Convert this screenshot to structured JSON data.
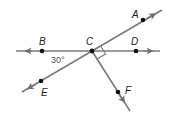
{
  "figure": {
    "type": "geometry",
    "colors": {
      "line": "#7a7a7a",
      "point": "#111111",
      "label": "#222222",
      "angle_label": "#555555"
    },
    "points": [
      {
        "id": "A",
        "label": "A",
        "x": 143,
        "y": 20,
        "lx": 132,
        "ly": 18
      },
      {
        "id": "B",
        "label": "B",
        "x": 42,
        "y": 51,
        "lx": 39,
        "ly": 44
      },
      {
        "id": "C",
        "label": "C",
        "x": 92,
        "y": 51,
        "lx": 87,
        "ly": 44
      },
      {
        "id": "D",
        "label": "D",
        "x": 136,
        "y": 51,
        "lx": 132,
        "ly": 44
      },
      {
        "id": "E",
        "label": "E",
        "x": 41,
        "y": 81,
        "lx": 41,
        "ly": 95
      },
      {
        "id": "F",
        "label": "F",
        "x": 118,
        "y": 92,
        "lx": 125,
        "ly": 93
      }
    ],
    "lines": [
      {
        "name": "line-BD",
        "through": [
          "B",
          "C",
          "D"
        ]
      },
      {
        "name": "line-AE",
        "through": [
          "A",
          "C",
          "E"
        ]
      },
      {
        "name": "ray-CF",
        "through": [
          "C",
          "F"
        ]
      }
    ],
    "angle_label": {
      "text": "30°",
      "between": [
        "B",
        "C",
        "E"
      ]
    },
    "right_angle": {
      "at": "C",
      "between": [
        "A",
        "F"
      ]
    }
  }
}
